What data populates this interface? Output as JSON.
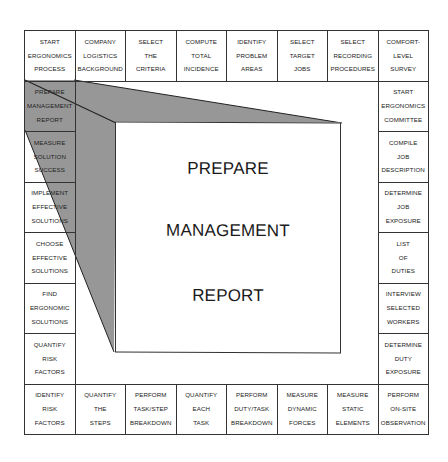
{
  "diagram": {
    "type": "board-game-style process flow",
    "center": {
      "lines": [
        "PREPARE",
        "MANAGEMENT",
        "REPORT"
      ]
    },
    "highlighted_cell": "PREPARE MANAGEMENT REPORT",
    "colors": {
      "border": "#333333",
      "shade": "#8c8c8c",
      "background": "#ffffff"
    },
    "top_row": [
      {
        "lines": [
          "START",
          "ERGONOMICS",
          "PROCESS"
        ]
      },
      {
        "lines": [
          "COMPANY",
          "LOGISTICS",
          "BACKGROUND"
        ]
      },
      {
        "lines": [
          "SELECT",
          "THE",
          "CRITERIA"
        ]
      },
      {
        "lines": [
          "COMPUTE",
          "TOTAL",
          "INCIDENCE"
        ]
      },
      {
        "lines": [
          "IDENTIFY",
          "PROBLEM",
          "AREAS"
        ]
      },
      {
        "lines": [
          "SELECT",
          "TARGET",
          "JOBS"
        ]
      },
      {
        "lines": [
          "SELECT",
          "RECORDING",
          "PROCEDURES"
        ]
      },
      {
        "lines": [
          "COMFORT-",
          "LEVEL",
          "SURVEY"
        ]
      }
    ],
    "right_column": [
      {
        "lines": [
          "START",
          "ERGONOMICS",
          "COMMITTEE"
        ]
      },
      {
        "lines": [
          "COMPILE",
          "JOB",
          "DESCRIPTION"
        ]
      },
      {
        "lines": [
          "DETERMINE",
          "JOB",
          "EXPOSURE"
        ]
      },
      {
        "lines": [
          "LIST",
          "OF",
          "DUTIES"
        ]
      },
      {
        "lines": [
          "INTERVIEW",
          "SELECTED",
          "WORKERS"
        ]
      },
      {
        "lines": [
          "DETERMINE",
          "DUTY",
          "EXPOSURE"
        ]
      }
    ],
    "bottom_row": [
      {
        "lines": [
          "IDENTIFY",
          "RISK",
          "FACTORS"
        ]
      },
      {
        "lines": [
          "QUANTIFY",
          "THE",
          "STEPS"
        ]
      },
      {
        "lines": [
          "PERFORM",
          "TASK/STEP",
          "BREAKDOWN"
        ]
      },
      {
        "lines": [
          "QUANTIFY",
          "EACH",
          "TASK"
        ]
      },
      {
        "lines": [
          "PERFORM",
          "DUTY/TASK",
          "BREAKDOWN"
        ]
      },
      {
        "lines": [
          "MEASURE",
          "DYNAMIC",
          "FORCES"
        ]
      },
      {
        "lines": [
          "MEASURE",
          "STATIC",
          "ELEMENTS"
        ]
      },
      {
        "lines": [
          "PERFORM",
          "ON-SITE",
          "OBSERVATION"
        ]
      }
    ],
    "left_column": [
      {
        "lines": [
          "PREPARE",
          "MANAGEMENT",
          "REPORT"
        ]
      },
      {
        "lines": [
          "MEASURE",
          "SOLUTION",
          "SUCCESS"
        ]
      },
      {
        "lines": [
          "IMPLEMENT",
          "EFFECTIVE",
          "SOLUTIONS"
        ]
      },
      {
        "lines": [
          "CHOOSE",
          "EFFECTIVE",
          "SOLUTIONS"
        ]
      },
      {
        "lines": [
          "FIND",
          "ERGONOMIC",
          "SOLUTIONS"
        ]
      },
      {
        "lines": [
          "QUANTIFY",
          "RISK",
          "FACTORS"
        ]
      }
    ]
  }
}
